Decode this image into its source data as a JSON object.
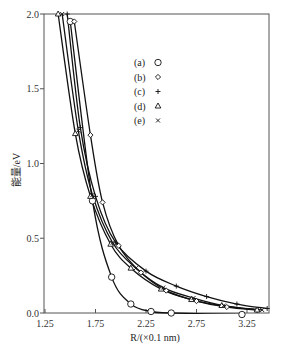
{
  "chart_data": {
    "type": "line",
    "title": "",
    "xlabel": "R/(×0.1 nm)",
    "ylabel": "能量/eV",
    "xlim": [
      1.25,
      3.47
    ],
    "ylim": [
      0.0,
      2.0
    ],
    "x_ticks": [
      "1.25",
      "1.75",
      "2.25",
      "2.75",
      "3.25"
    ],
    "y_ticks": [
      "0.0",
      "0.5",
      "1.0",
      "1.5",
      "2.0"
    ],
    "grid": false,
    "legend_position": "upper-center",
    "legend": [
      {
        "label": "(a)",
        "marker": "○"
      },
      {
        "label": "(b)",
        "marker": "◇"
      },
      {
        "label": "(c)",
        "marker": "+"
      },
      {
        "label": "(d)",
        "marker": "△"
      },
      {
        "label": "(e)",
        "marker": "×"
      }
    ],
    "series": [
      {
        "name": "(a)",
        "marker": "circle",
        "x": [
          1.5,
          1.72,
          1.91,
          2.1,
          2.3,
          2.5,
          3.2
        ],
        "y": [
          1.95,
          0.75,
          0.24,
          0.06,
          0.01,
          0.0,
          -0.01
        ]
      },
      {
        "name": "(b)",
        "marker": "diamond",
        "x": [
          1.54,
          1.7,
          1.82,
          1.98,
          2.2,
          2.45,
          2.75,
          3.05,
          3.35
        ],
        "y": [
          1.95,
          1.19,
          0.74,
          0.45,
          0.27,
          0.15,
          0.08,
          0.04,
          0.02
        ]
      },
      {
        "name": "(c)",
        "marker": "plus",
        "x": [
          1.47,
          1.6,
          1.75,
          1.95,
          2.25,
          2.55,
          2.85,
          3.15,
          3.45
        ],
        "y": [
          2.0,
          1.24,
          0.78,
          0.47,
          0.28,
          0.18,
          0.11,
          0.06,
          0.03
        ]
      },
      {
        "name": "(d)",
        "marker": "triangle",
        "x": [
          1.38,
          1.55,
          1.7,
          1.9,
          2.1,
          2.4,
          2.7,
          3.0,
          3.35
        ],
        "y": [
          2.0,
          1.2,
          0.78,
          0.46,
          0.3,
          0.16,
          0.09,
          0.05,
          0.02
        ]
      },
      {
        "name": "(e)",
        "marker": "cross",
        "x": [
          1.42,
          1.58,
          1.72,
          1.92,
          2.15,
          2.42,
          2.72,
          3.02,
          3.4
        ],
        "y": [
          2.0,
          1.22,
          0.79,
          0.47,
          0.3,
          0.17,
          0.1,
          0.05,
          0.02
        ]
      }
    ]
  }
}
